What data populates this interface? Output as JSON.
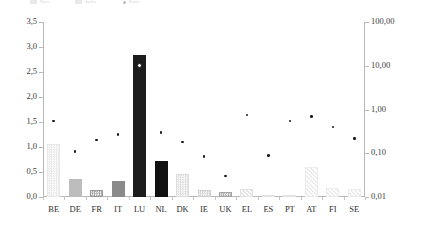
{
  "legend": {
    "items": [
      {
        "label": "Bars",
        "swatch": "bar-swatch"
      },
      {
        "label": "Index",
        "swatch": "bar-swatch"
      },
      {
        "label": "Ratio",
        "swatch": "dot-swatch"
      }
    ]
  },
  "axes": {
    "left_ticks": [
      "0,0",
      "0,5",
      "1,0",
      "1,5",
      "2,0",
      "2,5",
      "3,0",
      "3,5"
    ],
    "right_ticks": [
      "0,01",
      "0,10",
      "1,00",
      "10,00",
      "100,00"
    ],
    "left_min": 0,
    "left_max": 3.5,
    "right_min": 0.01,
    "right_max": 100
  },
  "chart_data": {
    "type": "bar",
    "title": "",
    "subtitle": "",
    "xlabel": "",
    "ylabel": "",
    "y2label": "",
    "grid": false,
    "legend_position": "top-left",
    "categories": [
      "BE",
      "DE",
      "FR",
      "IT",
      "LU",
      "NL",
      "DK",
      "IE",
      "UK",
      "EL",
      "ES",
      "PT",
      "AT",
      "FI",
      "SE"
    ],
    "ylim": [
      0,
      3.5
    ],
    "y2lim": [
      0.01,
      100
    ],
    "y2scale": "log",
    "series": [
      {
        "name": "Bars",
        "type": "bar",
        "axis": "left",
        "values": [
          1.07,
          0.37,
          0.15,
          0.33,
          2.85,
          0.73,
          0.46,
          0.14,
          0.1,
          0.16,
          0.04,
          0.05,
          0.6,
          0.18,
          0.17
        ],
        "fills": [
          "#e8e8e8",
          "#bdbdbd",
          "#9a9a9a",
          "#8a8a8a",
          "#1c1c1c",
          "#111111",
          "#dcdcdc",
          "#cfcfcf",
          "#a5a5a5",
          "#e3e3e3",
          "#e3e3e3",
          "#e3e3e3",
          "#ececec",
          "#ececec",
          "#ececec"
        ],
        "patterns": [
          "dots",
          "solid",
          "dots",
          "solid",
          "solid",
          "solid",
          "dots",
          "dots",
          "dots",
          "hatch",
          "hatch",
          "hatch",
          "hatch",
          "hatch",
          "hatch"
        ]
      },
      {
        "name": "Ratio",
        "type": "scatter",
        "axis": "right",
        "values": [
          0.55,
          0.11,
          0.2,
          0.27,
          10.0,
          0.3,
          0.18,
          0.085,
          0.03,
          0.75,
          0.09,
          0.55,
          0.7,
          0.4,
          0.22
        ],
        "markers": [
          "plain",
          "plain",
          "plain",
          "plain",
          "ringed",
          "plain",
          "plain",
          "plain",
          "plain",
          "plain",
          "plain",
          "plain",
          "plain",
          "plain",
          "plain"
        ]
      }
    ]
  },
  "colors": {
    "axis": "#b9b9b9",
    "text": "#2e2e2e",
    "marker": "#1a1a1a",
    "background": "#ffffff"
  }
}
